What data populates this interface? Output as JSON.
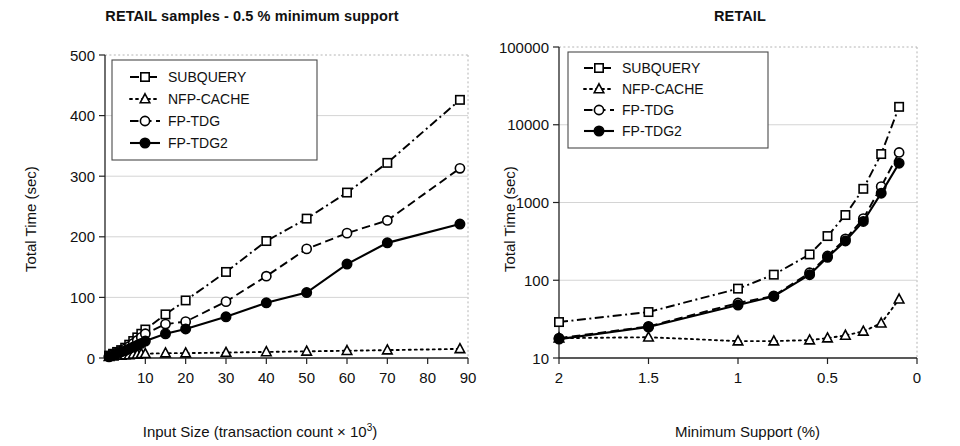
{
  "figure": {
    "width": 960,
    "height": 446,
    "background": "#ffffff",
    "ink": "#111111"
  },
  "legend": {
    "entries": [
      {
        "label": "SUBQUERY",
        "marker": "open-square",
        "line": "dash-dot"
      },
      {
        "label": "NFP-CACHE",
        "marker": "open-triangle",
        "line": "dotted"
      },
      {
        "label": "FP-TDG",
        "marker": "open-circle",
        "line": "dashed"
      },
      {
        "label": "FP-TDG2",
        "marker": "filled-circle",
        "line": "solid"
      }
    ]
  },
  "chart_data": [
    {
      "id": "left",
      "type": "line",
      "title": "RETAIL samples - 0.5 % minimum support",
      "xlabel": "Input Size (transaction count × 10³)",
      "ylabel": "Total Time (sec)",
      "xscale": "linear",
      "yscale": "linear",
      "xlim": [
        0,
        90
      ],
      "ylim": [
        0,
        500
      ],
      "xticks": [
        10,
        20,
        30,
        40,
        50,
        60,
        70,
        80,
        90
      ],
      "xticklabels": [
        "10",
        "20",
        "30",
        "40",
        "50",
        "60",
        "70",
        "80",
        "90"
      ],
      "yticks": [
        0,
        100,
        200,
        300,
        400,
        500
      ],
      "yticklabels": [
        "0",
        "100",
        "200",
        "300",
        "400",
        "500"
      ],
      "grid": "horizontal",
      "legend_position": "upper-left",
      "series": [
        {
          "name": "SUBQUERY",
          "marker": "open-square",
          "line": "dash-dot",
          "x": [
            1,
            2,
            3,
            4,
            5,
            6,
            7,
            8,
            9,
            10,
            15,
            20,
            30,
            40,
            50,
            60,
            70,
            88
          ],
          "y": [
            4,
            7,
            10,
            13,
            17,
            22,
            28,
            34,
            40,
            47,
            72,
            95,
            142,
            193,
            230,
            273,
            322,
            426
          ]
        },
        {
          "name": "NFP-CACHE",
          "marker": "open-triangle",
          "line": "dotted",
          "x": [
            1,
            2,
            3,
            4,
            5,
            6,
            7,
            8,
            9,
            10,
            15,
            20,
            30,
            40,
            50,
            60,
            70,
            88
          ],
          "y": [
            2,
            3,
            4,
            4,
            5,
            5,
            6,
            6,
            7,
            7,
            8,
            8,
            9,
            10,
            11,
            12,
            13,
            15
          ]
        },
        {
          "name": "FP-TDG",
          "marker": "open-circle",
          "line": "dashed",
          "x": [
            1,
            2,
            3,
            4,
            5,
            6,
            7,
            8,
            9,
            10,
            15,
            20,
            30,
            40,
            50,
            60,
            70,
            88
          ],
          "y": [
            3,
            6,
            9,
            12,
            15,
            19,
            24,
            29,
            34,
            40,
            56,
            60,
            93,
            135,
            180,
            206,
            227,
            313
          ]
        },
        {
          "name": "FP-TDG2",
          "marker": "filled-circle",
          "line": "solid",
          "x": [
            1,
            2,
            3,
            4,
            5,
            6,
            7,
            8,
            9,
            10,
            15,
            20,
            30,
            40,
            50,
            60,
            70,
            88
          ],
          "y": [
            2,
            5,
            7,
            10,
            12,
            15,
            18,
            21,
            24,
            28,
            40,
            48,
            68,
            91,
            108,
            155,
            190,
            221
          ]
        }
      ]
    },
    {
      "id": "right",
      "type": "line",
      "title": "RETAIL",
      "xlabel": "Minimum Support (%)",
      "ylabel": "Total Time (sec)",
      "xscale": "linear-reversed",
      "yscale": "log",
      "xlim": [
        2,
        0
      ],
      "ylim": [
        10,
        100000
      ],
      "xticks": [
        2,
        1.5,
        1,
        0.5,
        0
      ],
      "xticklabels": [
        "2",
        "1.5",
        "1",
        "0.5",
        "0"
      ],
      "yticks": [
        10,
        100,
        1000,
        10000,
        100000
      ],
      "yticklabels": [
        "10",
        "100",
        "1000",
        "10000",
        "100000"
      ],
      "grid": "horizontal",
      "legend_position": "upper-left",
      "series": [
        {
          "name": "SUBQUERY",
          "marker": "open-square",
          "line": "dash-dot",
          "x": [
            2.0,
            1.5,
            1.0,
            0.8,
            0.6,
            0.5,
            0.4,
            0.3,
            0.2,
            0.1
          ],
          "y": [
            29,
            39,
            78,
            118,
            215,
            370,
            690,
            1500,
            4200,
            17000
          ]
        },
        {
          "name": "NFP-CACHE",
          "marker": "open-triangle",
          "line": "dotted",
          "x": [
            2.0,
            1.5,
            1.0,
            0.8,
            0.6,
            0.5,
            0.4,
            0.3,
            0.2,
            0.1
          ],
          "y": [
            18,
            18.5,
            16.5,
            16.5,
            17,
            18,
            19.5,
            22,
            28,
            57
          ]
        },
        {
          "name": "FP-TDG",
          "marker": "open-circle",
          "line": "dashed",
          "x": [
            2.0,
            1.5,
            1.0,
            0.8,
            0.6,
            0.5,
            0.4,
            0.3,
            0.2,
            0.1
          ],
          "y": [
            18,
            25.5,
            51,
            63,
            125,
            205,
            340,
            620,
            1600,
            4400
          ]
        },
        {
          "name": "FP-TDG2",
          "marker": "filled-circle",
          "line": "solid",
          "x": [
            2.0,
            1.5,
            1.0,
            0.8,
            0.6,
            0.5,
            0.4,
            0.3,
            0.2,
            0.1
          ],
          "y": [
            17.5,
            25,
            48,
            62,
            118,
            197,
            320,
            570,
            1320,
            3200
          ]
        }
      ]
    }
  ]
}
